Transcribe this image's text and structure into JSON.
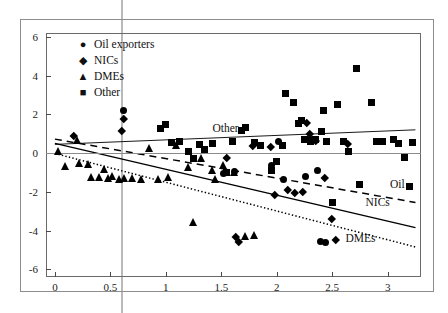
{
  "chart_data": {
    "type": "scatter",
    "title": "",
    "xlabel": "",
    "ylabel": "",
    "xlim": [
      -0.08,
      3.3
    ],
    "ylim": [
      -6.4,
      6.2
    ],
    "xticks": [
      "0",
      "0.5",
      "1",
      "1.5",
      "2",
      "2.5",
      "3"
    ],
    "xtick_values": [
      0,
      0.5,
      1,
      1.5,
      2,
      2.5,
      3
    ],
    "yticks": [
      "6",
      "4",
      "2",
      "0",
      "-2",
      "-4",
      "-6"
    ],
    "ytick_values": [
      6,
      4,
      2,
      0,
      -2,
      -4,
      -6
    ],
    "grid": false,
    "legend_position": "top-left",
    "zero_line": true,
    "legend": [
      {
        "label": "Oil exporters",
        "marker": "circle",
        "glyph": "●"
      },
      {
        "label": "NICs",
        "marker": "diamond",
        "glyph": "◆"
      },
      {
        "label": "DMEs",
        "marker": "triangle",
        "glyph": "▲"
      },
      {
        "label": "Other",
        "marker": "square",
        "glyph": "■"
      }
    ],
    "series": [
      {
        "name": "Oil exporters",
        "marker": "circle",
        "points": [
          [
            0.62,
            2.2
          ],
          [
            1.52,
            -1.05
          ],
          [
            1.62,
            -0.95
          ],
          [
            1.95,
            -0.65
          ],
          [
            2.06,
            -1.35
          ],
          [
            2.26,
            -1.2
          ],
          [
            2.3,
            0.72
          ],
          [
            2.37,
            -0.9
          ],
          [
            2.39,
            -4.55
          ],
          [
            2.44,
            -4.6
          ],
          [
            2.02,
            0.6
          ]
        ]
      },
      {
        "name": "NICs",
        "marker": "diamond",
        "points": [
          [
            0.17,
            0.9
          ],
          [
            0.62,
            1.75
          ],
          [
            0.6,
            1.15
          ],
          [
            1.55,
            -0.25
          ],
          [
            1.63,
            -4.3
          ],
          [
            1.66,
            -4.6
          ],
          [
            1.78,
            0.38
          ],
          [
            1.95,
            0.35
          ],
          [
            2.1,
            -1.9
          ],
          [
            2.23,
            -2.0
          ],
          [
            2.27,
            1.55
          ],
          [
            2.3,
            1.0
          ],
          [
            2.35,
            0.62
          ],
          [
            2.43,
            -1.25
          ],
          [
            2.5,
            -3.4
          ],
          [
            2.53,
            -4.5
          ],
          [
            2.64,
            0.5
          ],
          [
            1.98,
            -2.15
          ],
          [
            2.16,
            -2.05
          ]
        ]
      },
      {
        "name": "DMEs",
        "marker": "triangle",
        "points": [
          [
            0.03,
            0.05
          ],
          [
            0.1,
            -0.72
          ],
          [
            0.2,
            0.62
          ],
          [
            0.22,
            -0.55
          ],
          [
            0.3,
            -0.62
          ],
          [
            0.33,
            -1.3
          ],
          [
            0.45,
            -0.9
          ],
          [
            0.52,
            -1.25
          ],
          [
            0.58,
            -1.4
          ],
          [
            0.63,
            -1.35
          ],
          [
            0.7,
            -1.35
          ],
          [
            0.78,
            -1.38
          ],
          [
            0.85,
            0.2
          ],
          [
            0.93,
            -1.4
          ],
          [
            1.02,
            -1.3
          ],
          [
            1.1,
            0.35
          ],
          [
            1.2,
            -0.75
          ],
          [
            1.25,
            -3.6
          ],
          [
            1.32,
            -0.3
          ],
          [
            1.42,
            -0.95
          ],
          [
            1.45,
            -1.4
          ],
          [
            1.52,
            -0.65
          ],
          [
            1.62,
            -1.05
          ],
          [
            1.72,
            -4.35
          ],
          [
            1.8,
            -4.3
          ],
          [
            0.4,
            -1.3
          ],
          [
            0.48,
            -1.35
          ]
        ]
      },
      {
        "name": "Other",
        "marker": "square",
        "points": [
          [
            0.95,
            1.25
          ],
          [
            1.0,
            1.45
          ],
          [
            1.05,
            0.55
          ],
          [
            1.12,
            0.6
          ],
          [
            1.2,
            0.08
          ],
          [
            1.25,
            -0.3
          ],
          [
            1.3,
            0.45
          ],
          [
            1.35,
            0.18
          ],
          [
            1.42,
            0.48
          ],
          [
            1.55,
            -1.0
          ],
          [
            1.6,
            0.62
          ],
          [
            1.68,
            1.15
          ],
          [
            1.72,
            1.3
          ],
          [
            1.8,
            0.55
          ],
          [
            1.85,
            0.4
          ],
          [
            1.95,
            -0.9
          ],
          [
            2.0,
            -0.45
          ],
          [
            2.08,
            3.1
          ],
          [
            2.15,
            2.6
          ],
          [
            2.2,
            1.52
          ],
          [
            2.22,
            1.7
          ],
          [
            2.25,
            0.7
          ],
          [
            2.3,
            0.6
          ],
          [
            2.35,
            0.68
          ],
          [
            2.4,
            1.1
          ],
          [
            2.45,
            0.58
          ],
          [
            2.5,
            -2.55
          ],
          [
            2.55,
            2.5
          ],
          [
            2.6,
            0.62
          ],
          [
            2.65,
            0.1
          ],
          [
            2.72,
            4.35
          ],
          [
            2.75,
            -1.6
          ],
          [
            2.85,
            2.6
          ],
          [
            2.9,
            0.62
          ],
          [
            2.95,
            0.58
          ],
          [
            3.05,
            0.72
          ],
          [
            3.1,
            0.5
          ],
          [
            3.15,
            -0.25
          ],
          [
            3.2,
            -1.75
          ],
          [
            3.22,
            0.55
          ],
          [
            2.42,
            2.2
          ],
          [
            2.05,
            0.4
          ]
        ]
      }
    ],
    "trendlines": [
      {
        "name": "Other",
        "label": "Other",
        "style": "solid",
        "thin": true,
        "x0": 0.0,
        "y0": 0.45,
        "x1": 3.25,
        "y1": 1.2,
        "label_x": 1.42,
        "label_y": 1.18
      },
      {
        "name": "Oil",
        "label": "Oil",
        "style": "dashed",
        "thin": false,
        "x0": 0.0,
        "y0": 0.72,
        "x1": 3.25,
        "y1": -2.55,
        "label_x": 3.02,
        "label_y": -1.72
      },
      {
        "name": "NICs",
        "label": "NICs",
        "style": "solid",
        "thin": false,
        "x0": 0.0,
        "y0": 0.5,
        "x1": 3.25,
        "y1": -3.85,
        "label_x": 2.8,
        "label_y": -2.62
      },
      {
        "name": "DMEs",
        "label": "DMEs",
        "style": "dotted",
        "thin": false,
        "x0": 0.0,
        "y0": -0.02,
        "x1": 3.25,
        "y1": -4.85,
        "label_x": 2.62,
        "label_y": -4.5
      }
    ]
  }
}
